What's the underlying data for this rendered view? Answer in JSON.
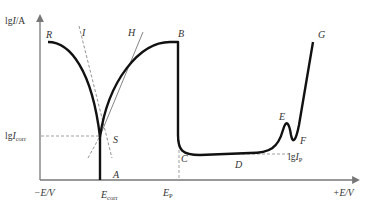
{
  "diagram": {
    "y_axis": {
      "label_prefix": "lg",
      "label_var": "I",
      "label_unit": "/A"
    },
    "x_axis": {
      "neg_label": "−E/V",
      "pos_label": "+E/V",
      "ticks": [
        {
          "main": "E",
          "sub": "corr"
        },
        {
          "main": "E",
          "sub": "P"
        }
      ]
    },
    "y_levels": [
      {
        "prefix": "lg",
        "main": "I",
        "sub": "corr"
      },
      {
        "prefix": "lg",
        "main": "I",
        "sub": "P"
      }
    ],
    "points": [
      "R",
      "I",
      "H",
      "B",
      "S",
      "A",
      "C",
      "D",
      "E",
      "F",
      "G"
    ],
    "colors": {
      "curve": "#111111",
      "axis": "#777777",
      "dashed": "#888888",
      "tangent": "#666666"
    }
  }
}
